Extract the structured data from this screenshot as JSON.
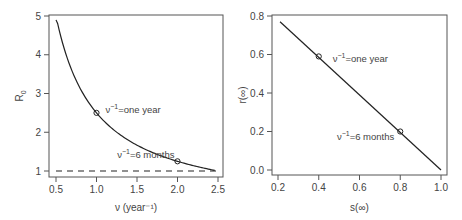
{
  "chart_data": [
    {
      "type": "line",
      "title": "",
      "xlabel": "ν (year⁻¹)",
      "ylabel": "R0",
      "xlim": [
        0.5,
        2.5
      ],
      "ylim": [
        1,
        5
      ],
      "xticks": [
        "0.5",
        "1.0",
        "1.5",
        "2.0",
        "2.5"
      ],
      "yticks": [
        "1",
        "2",
        "3",
        "4",
        "5"
      ],
      "grid": false,
      "series": [
        {
          "name": "R0 curve",
          "style": "solid",
          "x": [
            0.5,
            0.75,
            1.0,
            1.25,
            1.5,
            1.75,
            2.0,
            2.25,
            2.47
          ],
          "y": [
            4.9,
            3.3,
            2.5,
            2.0,
            1.67,
            1.43,
            1.25,
            1.11,
            1.0
          ]
        },
        {
          "name": "R0 = 1 threshold",
          "style": "dashed",
          "x": [
            0.5,
            2.5
          ],
          "y": [
            1,
            1
          ]
        }
      ],
      "annotations": [
        {
          "x": 1.0,
          "y": 2.5,
          "text": "ν⁻¹=one year"
        },
        {
          "x": 2.0,
          "y": 1.25,
          "text": "ν⁻¹=6 months"
        }
      ]
    },
    {
      "type": "line",
      "title": "",
      "xlabel": "s(∞)",
      "ylabel": "r(∞)",
      "xlim": [
        0.2,
        1.0
      ],
      "ylim": [
        0.0,
        0.8
      ],
      "xticks": [
        "0.2",
        "0.4",
        "0.6",
        "0.8",
        "1.0"
      ],
      "yticks": [
        "0.0",
        "0.2",
        "0.4",
        "0.6",
        "0.8"
      ],
      "grid": false,
      "series": [
        {
          "name": "r vs s",
          "style": "solid",
          "x": [
            0.21,
            1.0
          ],
          "y": [
            0.77,
            0.0
          ]
        }
      ],
      "annotations": [
        {
          "x": 0.4,
          "y": 0.59,
          "text": "ν⁻¹=one year"
        },
        {
          "x": 0.8,
          "y": 0.2,
          "text": "ν⁻¹=6 months"
        }
      ]
    }
  ]
}
